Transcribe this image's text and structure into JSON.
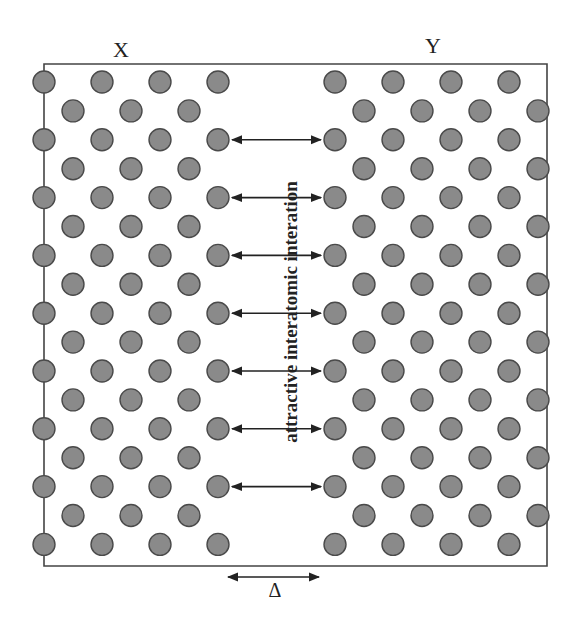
{
  "figure": {
    "labels": {
      "left_block": "X",
      "right_block": "Y",
      "interaction": "attractive interatomic interation",
      "gap": "Δ"
    },
    "colors": {
      "atom_fill": "#8a8a8a",
      "atom_stroke": "#4a4a4a",
      "line": "#444444",
      "arrow": "#222222",
      "background": "#ffffff"
    },
    "frame": {
      "left": 44,
      "top": 64,
      "right": 547,
      "bottom": 566
    },
    "lattice": {
      "rows": 17,
      "row_start_y": 82,
      "row_step": 28.9,
      "atom_radius": 11,
      "x_block": {
        "even_cols": [
          44,
          102,
          160,
          218
        ],
        "odd_cols": [
          73,
          131,
          189
        ]
      },
      "y_block": {
        "even_cols": [
          335,
          393,
          451,
          509
        ],
        "odd_cols": [
          364,
          422,
          480,
          538
        ]
      }
    },
    "interaction_arrows": {
      "rows": [
        2,
        4,
        6,
        8,
        10,
        12,
        14
      ],
      "x1": 232,
      "x2": 321
    },
    "gap_arrow": {
      "x1": 228,
      "x2": 319,
      "y": 577
    }
  }
}
